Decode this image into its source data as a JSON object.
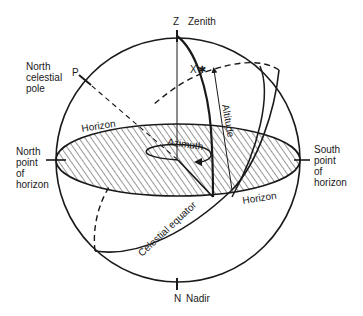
{
  "diagram": {
    "labels": {
      "zenith_letter": "Z",
      "zenith": "Zenith",
      "nadir_letter": "N",
      "nadir": "Nadir",
      "pole_letter": "P",
      "north_celestial_pole": [
        "North",
        "celestial",
        "pole"
      ],
      "north_point": [
        "North",
        "point",
        "of",
        "horizon"
      ],
      "south_point": [
        "South",
        "point",
        "of",
        "horizon"
      ],
      "star_letter": "X",
      "star_glyph": "✱",
      "horizon_upper": "Horizon",
      "horizon_lower": "Horizon",
      "azimuth": "Azimuth",
      "altitude": "Altitude",
      "celestial_equator": "Celestial equator"
    },
    "colors": {
      "ink": "#1a1a1a",
      "background": "#ffffff"
    }
  }
}
